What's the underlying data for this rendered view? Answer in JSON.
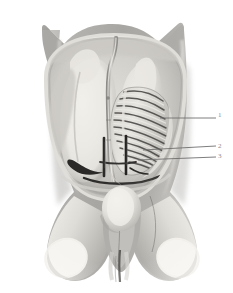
{
  "figure": {
    "kind": "anatomical-model-photograph",
    "background_color": "#ffffff",
    "dominant_tones": {
      "paper_white": "#fdfdfd",
      "highlight": "#f0efed",
      "light_tissue": "#d9d7d3",
      "mid_tissue": "#b9b7b3",
      "shadow_tissue": "#8f8d8a",
      "deep_shadow": "#5f5d5b",
      "instrument_dark": "#2b2b2b",
      "leader_line": "#6f6f6f",
      "label_text": "#8d8d8d"
    },
    "width": 233,
    "height": 293
  },
  "callouts": [
    {
      "id": "callout-1",
      "label": "1",
      "label_x": 218,
      "label_y": 112,
      "line_start_x": 160,
      "line_start_y": 118,
      "line_end_x": 216,
      "line_end_y": 118,
      "points_to": "upper region of the ribbed lattice structure"
    },
    {
      "id": "callout-2",
      "label": "2",
      "label_x": 218,
      "label_y": 143,
      "line_start_x": 143,
      "line_start_y": 150,
      "line_end_x": 216,
      "line_end_y": 146,
      "points_to": "mid-lower region of the ribbed lattice structure"
    },
    {
      "id": "callout-3",
      "label": "3",
      "label_x": 218,
      "label_y": 153,
      "line_start_x": 138,
      "line_start_y": 160,
      "line_end_x": 216,
      "line_end_y": 157,
      "points_to": "lower margin of the ribbed lattice structure"
    }
  ],
  "regions": [
    {
      "name": "torso-outer-wall",
      "description": "Outer grey abdominal wall with wing-like flaps at the top corners"
    },
    {
      "name": "abdominal-cavity",
      "description": "Opened oval cavity lined by a pale rim"
    },
    {
      "name": "left-viscus",
      "description": "Large pale elongated organ filling the left half of the cavity"
    },
    {
      "name": "central-tube",
      "description": "Thin vertical tube running from the top of the cavity down to the pelvic floor"
    },
    {
      "name": "ribbed-lattice",
      "description": "Fan-shaped striped structure of parallel ribs on the right side of the cavity"
    },
    {
      "name": "dark-instruments",
      "description": "Dark near-black instrument shafts crossing the lower cavity"
    },
    {
      "name": "pelvic-bulb",
      "description": "Rounded pale bulb at the pelvic outlet below the cavity"
    },
    {
      "name": "thigh-stump-left",
      "description": "Cut cylindrical left thigh stump with pale elliptical cut face"
    },
    {
      "name": "thigh-stump-right",
      "description": "Cut cylindrical right thigh stump with pale elliptical cut face"
    },
    {
      "name": "perineal-cleft",
      "description": "Narrow dark vertical cleft between the thigh stumps"
    }
  ]
}
